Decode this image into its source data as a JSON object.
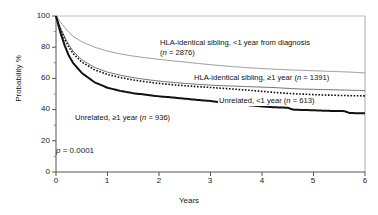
{
  "chart_data": {
    "type": "line",
    "title": "",
    "subtitle": "",
    "xlabel": "Years",
    "ylabel": "Probability %",
    "xlim": [
      0,
      6
    ],
    "ylim": [
      0,
      100
    ],
    "xticks": [
      "0",
      "1",
      "2",
      "3",
      "4",
      "5",
      "6"
    ],
    "yticks": [
      "0",
      "20",
      "40",
      "60",
      "80",
      "100"
    ],
    "grid": false,
    "legend_position": "inline-annotations",
    "annotations": [
      {
        "text": "p = 0.0001",
        "stat": "p",
        "value": "0.0001"
      }
    ],
    "series": [
      {
        "name": "HLA-identical sibling, <1 year from diagnosis",
        "n": 2876,
        "label_line1": "HLA-identical sibling, <1 year from diagnosis",
        "label_line2": "(n = 2876)",
        "style": "solid",
        "color": "#9b9b9b",
        "width": 1.0,
        "x": [
          0,
          0.08,
          0.17,
          0.25,
          0.33,
          0.5,
          0.75,
          1.0,
          1.25,
          1.5,
          1.75,
          2.0,
          2.25,
          2.5,
          2.75,
          3.0,
          3.25,
          3.5,
          3.75,
          4.0,
          4.25,
          4.5,
          4.75,
          5.0,
          5.25,
          5.5,
          5.75,
          6.0
        ],
        "y": [
          100,
          96.5,
          92.5,
          89.5,
          87.0,
          83.5,
          80.0,
          77.5,
          75.7,
          74.3,
          73.2,
          72.2,
          71.3,
          70.5,
          69.6,
          68.8,
          68.0,
          67.4,
          66.8,
          66.3,
          65.9,
          65.5,
          65.2,
          64.9,
          64.6,
          64.3,
          64.0,
          63.5
        ]
      },
      {
        "name": "HLA-identical sibling, ≥1 year",
        "n": 1391,
        "label_line1": "HLA-identical sibling, ≥1 year (n = 1391)",
        "label_line2": "",
        "style": "solid",
        "color": "#6e6e6e",
        "width": 1.0,
        "x": [
          0,
          0.08,
          0.17,
          0.25,
          0.33,
          0.5,
          0.75,
          1.0,
          1.25,
          1.5,
          1.75,
          2.0,
          2.25,
          2.5,
          2.75,
          3.0,
          3.25,
          3.5,
          3.75,
          4.0,
          4.25,
          4.5,
          4.75,
          5.0,
          5.25,
          5.5,
          5.75,
          6.0
        ],
        "y": [
          100,
          93.0,
          86.5,
          81.5,
          77.5,
          72.0,
          67.0,
          64.0,
          62.0,
          60.5,
          59.3,
          58.3,
          57.5,
          56.8,
          56.2,
          55.7,
          55.3,
          55.0,
          54.7,
          54.4,
          54.1,
          53.6,
          53.2,
          53.0,
          52.8,
          52.6,
          52.4,
          52.2
        ]
      },
      {
        "name": "Unrelated, <1 year",
        "n": 613,
        "label_line1": "Unrelated, <1 year (n = 613)",
        "label_line2": "",
        "style": "dotted",
        "color": "#111111",
        "width": 1.6,
        "x": [
          0,
          0.08,
          0.17,
          0.25,
          0.33,
          0.5,
          0.75,
          1.0,
          1.25,
          1.5,
          1.75,
          2.0,
          2.25,
          2.5,
          2.75,
          3.0,
          3.25,
          3.5,
          3.75,
          4.0,
          4.25,
          4.5,
          4.75,
          5.0,
          5.25,
          5.5,
          5.75,
          6.0
        ],
        "y": [
          100,
          92.0,
          85.0,
          80.0,
          76.0,
          70.5,
          65.5,
          62.5,
          60.5,
          59.0,
          57.8,
          56.8,
          56.0,
          55.3,
          54.7,
          54.2,
          53.6,
          53.0,
          52.4,
          51.7,
          51.0,
          50.4,
          50.0,
          49.6,
          49.3,
          49.1,
          48.9,
          48.8
        ]
      },
      {
        "name": "Unrelated, ≥1 year",
        "n": 936,
        "label_line1": "Unrelated, ≥1 year (n = 936)",
        "label_line2": "",
        "style": "solid",
        "color": "#111111",
        "width": 2.0,
        "x": [
          0,
          0.08,
          0.17,
          0.25,
          0.33,
          0.5,
          0.75,
          1.0,
          1.25,
          1.5,
          1.75,
          2.0,
          2.25,
          2.5,
          2.75,
          3.0,
          3.25,
          3.5,
          3.75,
          4.0,
          4.25,
          4.5,
          4.6,
          4.75,
          5.0,
          5.1,
          5.3,
          5.6,
          5.7,
          6.0
        ],
        "y": [
          100,
          90.0,
          81.0,
          74.5,
          70.0,
          63.5,
          57.5,
          54.0,
          52.0,
          50.5,
          49.5,
          48.5,
          47.8,
          47.0,
          46.2,
          45.5,
          44.5,
          43.5,
          42.8,
          42.0,
          41.5,
          41.2,
          40.0,
          39.8,
          39.6,
          39.4,
          39.2,
          39.0,
          37.8,
          37.6
        ]
      }
    ]
  },
  "axes": {
    "y_title": "Probability %",
    "x_title": "Years",
    "y_tick_labels": [
      "100",
      "80",
      "60",
      "40",
      "20",
      "0"
    ],
    "x_tick_labels": [
      "0",
      "1",
      "2",
      "3",
      "4",
      "5",
      "6"
    ]
  },
  "annotation": {
    "p_symbol": "p",
    "p_text": " = 0.0001"
  },
  "labels": {
    "s1_line1": "HLA-identical sibling, <1 year from diagnosis",
    "s1_line2_pre": "(",
    "s1_line2_n": "n",
    "s1_line2_post": " = 2876)",
    "s2_pre": "HLA-identical sibling, ≥1 year (",
    "s2_n": "n",
    "s2_post": " = 1391)",
    "s3_pre": "Unrelated, <1 year (",
    "s3_n": "n",
    "s3_post": " = 613)",
    "s4_pre": "Unrelated, ≥1 year (",
    "s4_n": "n",
    "s4_post": " = 936)"
  },
  "colors": {
    "axis": "#555555",
    "frame": "#bbbbbb",
    "series1": "#9b9b9b",
    "series2": "#6e6e6e",
    "series3": "#111111",
    "series4": "#111111"
  }
}
